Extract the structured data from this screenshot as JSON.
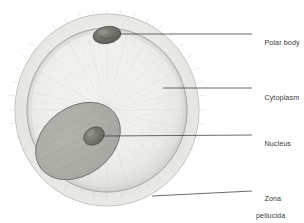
{
  "figure": {
    "style": "pencil-shaded biological illustration",
    "background_color": "#ffffff",
    "ink_color": "#3a3a3a"
  },
  "structures": {
    "zona_pellucida": {
      "name": "zona pellucida",
      "description": "pale outer glycoprotein coat ring",
      "fill_color": "#f2f2f0",
      "edge_color": "#b9b9b5"
    },
    "cytoplasm": {
      "name": "cytoplasm",
      "description": "granular interior of the egg with radial texture",
      "fill_color": "#fbfbfa",
      "rim_color": "#c9c9c4"
    },
    "nucleus": {
      "name": "nucleus",
      "description": "large tilted oval body in lower left of cytoplasm",
      "fill_color": "#b0b0aa",
      "edge_color": "#7d7d78"
    },
    "nucleolus": {
      "name": "nucleolus",
      "description": "small dark oval inside the nucleus",
      "fill_color": "#75756f"
    },
    "polar_body": {
      "name": "polar body",
      "description": "small dark oval near the top rim of the cytoplasm",
      "fill_color": "#6e6e68"
    }
  },
  "labels": [
    {
      "id": "polar-body",
      "text": "Polar body",
      "line2": "",
      "x": 256,
      "y": 30,
      "leader": {
        "x1": 120,
        "y1": 34,
        "x2": 252,
        "y2": 34
      }
    },
    {
      "id": "cytoplasm",
      "text": "Cytoplasm",
      "line2": "",
      "x": 256,
      "y": 85,
      "leader": {
        "x1": 163,
        "y1": 88,
        "x2": 252,
        "y2": 88
      }
    },
    {
      "id": "nucleus",
      "text": "Nucleus",
      "line2": "",
      "x": 256,
      "y": 131,
      "leader": {
        "x1": 102,
        "y1": 136,
        "x2": 252,
        "y2": 135
      }
    },
    {
      "id": "zona-pellucida",
      "text": "Zona",
      "line2": "pellucida",
      "x": 256,
      "y": 186,
      "leader": {
        "x1": 152,
        "y1": 196,
        "x2": 252,
        "y2": 191
      }
    }
  ]
}
